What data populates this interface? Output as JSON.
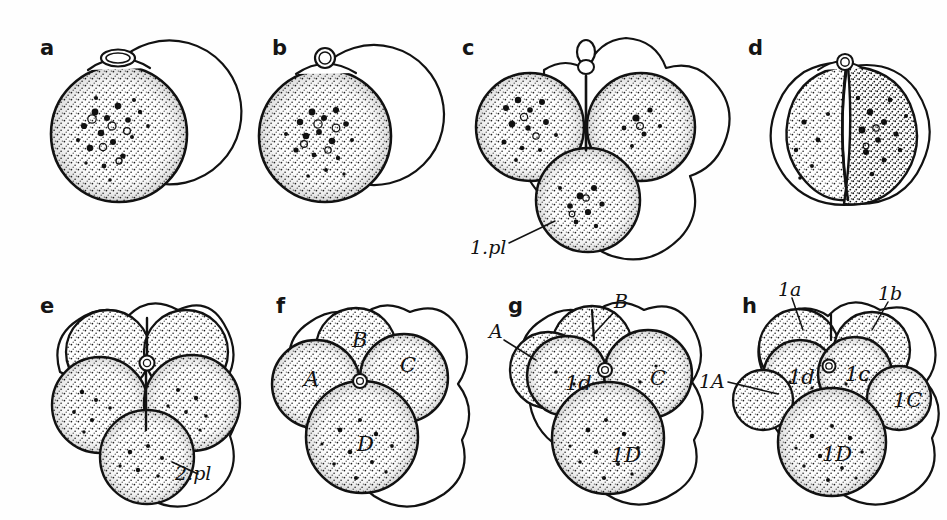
{
  "figure": {
    "kind": "embryology-plate",
    "background_color": "#fefefe",
    "ink_color": "#121212",
    "width": 947,
    "height": 520
  },
  "panels": [
    {
      "id": "a",
      "letter": "a",
      "letter_x": 40,
      "letter_y": 38,
      "stage": "uncleaved egg with first polar body",
      "cells": [],
      "structures": []
    },
    {
      "id": "b",
      "letter": "b",
      "letter_x": 272,
      "letter_y": 38,
      "stage": "uncleaved egg with rounded polar body",
      "cells": [],
      "structures": []
    },
    {
      "id": "c",
      "letter": "c",
      "letter_x": 462,
      "letter_y": 38,
      "stage": "three-lobed stage with first polar lobe",
      "cells": [],
      "structures": [
        {
          "text": "1.pl",
          "x": 470,
          "y": 238
        }
      ]
    },
    {
      "id": "d",
      "letter": "d",
      "letter_x": 748,
      "letter_y": 38,
      "stage": "two-cell stage",
      "cells": [],
      "structures": []
    },
    {
      "id": "e",
      "letter": "e",
      "letter_x": 40,
      "letter_y": 296,
      "stage": "four-cell stage with second polar lobe",
      "cells": [],
      "structures": [
        {
          "text": "2.pl",
          "x": 175,
          "y": 464
        }
      ]
    },
    {
      "id": "f",
      "letter": "f",
      "letter_x": 276,
      "letter_y": 296,
      "stage": "four-cell stage, quadrants named",
      "cells": [
        {
          "text": "A",
          "x": 304,
          "y": 369
        },
        {
          "text": "B",
          "x": 352,
          "y": 330
        },
        {
          "text": "C",
          "x": 400,
          "y": 355
        },
        {
          "text": "D",
          "x": 357,
          "y": 434
        }
      ],
      "structures": []
    },
    {
      "id": "g",
      "letter": "g",
      "letter_x": 508,
      "letter_y": 296,
      "stage": "first micromere 1d formed",
      "cells": [
        {
          "text": "1d",
          "x": 565,
          "y": 373
        },
        {
          "text": "C",
          "x": 650,
          "y": 368
        },
        {
          "text": "1D",
          "x": 611,
          "y": 445
        }
      ],
      "structures": [
        {
          "text": "A",
          "x": 489,
          "y": 332
        },
        {
          "text": "B",
          "x": 614,
          "y": 300
        }
      ]
    },
    {
      "id": "h",
      "letter": "h",
      "letter_x": 742,
      "letter_y": 296,
      "stage": "four micromeres formed",
      "cells": [
        {
          "text": "1d",
          "x": 798,
          "y": 371
        },
        {
          "text": "1c",
          "x": 851,
          "y": 368
        },
        {
          "text": "1C",
          "x": 897,
          "y": 394
        },
        {
          "text": "1D",
          "x": 834,
          "y": 448
        }
      ],
      "structures": [
        {
          "text": "1a",
          "x": 782,
          "y": 286
        },
        {
          "text": "1b",
          "x": 880,
          "y": 289
        },
        {
          "text": "1A",
          "x": 703,
          "y": 378
        }
      ]
    }
  ]
}
